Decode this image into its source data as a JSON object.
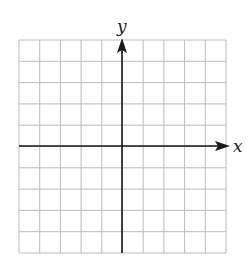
{
  "diagram": {
    "type": "cartesian-coordinate-grid",
    "grid": {
      "columns": 10,
      "rows": 10,
      "line_color": "#bdbdbd"
    },
    "axes": {
      "x_label": "x",
      "y_label": "y",
      "color": "#1a1a1a",
      "x_arrow": "positive",
      "y_arrow": "positive"
    }
  }
}
